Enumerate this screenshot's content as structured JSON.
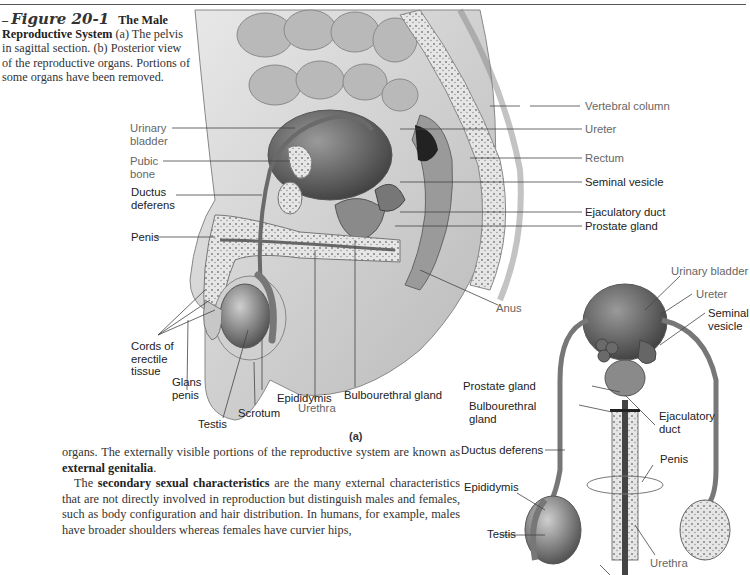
{
  "caption": {
    "figure_dash": "–",
    "figure_number": "Figure 20-1",
    "title": "The Male Reproductive System",
    "text": " (a) The pelvis in sagittal section. (b) Posterior view of the reproductive organs. Portions of some organs have been removed."
  },
  "panel_a": {
    "panel_label": "(a)",
    "labels": {
      "urinary_bladder": [
        "Urinary",
        "bladder"
      ],
      "pubic_bone": [
        "Pubic",
        "bone"
      ],
      "ductus_deferens": [
        "Ductus",
        "deferens"
      ],
      "penis": "Penis",
      "cords_of_erectile_tissue": [
        "Cords of",
        "erectile",
        "tissue"
      ],
      "glans_penis": [
        "Glans",
        "penis"
      ],
      "testis": "Testis",
      "scrotum": "Scrotum",
      "epididymis": "Epididymis",
      "urethra": "Urethra",
      "bulbourethral_gland": "Bulbourethral gland",
      "anus": "Anus",
      "vertebral_column": "Vertebral column",
      "ureter": "Ureter",
      "rectum": "Rectum",
      "seminal_vesicle": "Seminal vesicle",
      "ejaculatory_duct": "Ejaculatory duct",
      "prostate_gland": "Prostate gland"
    }
  },
  "panel_b": {
    "labels": {
      "urinary_bladder": "Urinary bladder",
      "ureter": "Ureter",
      "seminal_vesicle": [
        "Seminal",
        "vesicle"
      ],
      "prostate_gland": "Prostate gland",
      "bulbourethral_gland": [
        "Bulbourethral",
        "gland"
      ],
      "ejaculatory_duct": [
        "Ejaculatory",
        "duct"
      ],
      "ductus_deferens": "Ductus deferens",
      "penis": "Penis",
      "epididymis": "Epididymis",
      "testis": "Testis",
      "urethra": "Urethra"
    }
  },
  "body_text": {
    "para1_a": "organs. The externally visible portions of the reproductive system are known as ",
    "para1_bold": "external genitalia",
    "para1_b": ".",
    "para2_a": "The ",
    "para2_bold": "secondary sexual characteristics",
    "para2_b": " are the many external characteristics that are not directly involved in reproduction but distinguish males and females, such as body configuration and hair distribution. In humans, for example, males have broader shoulders whereas females have curvier hips,"
  }
}
